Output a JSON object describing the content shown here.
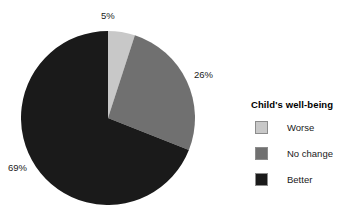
{
  "chart_data": {
    "type": "pie",
    "title": "",
    "legend_title": "Child's well-being",
    "legend_position": "right",
    "grid": false,
    "start_angle_deg": 0,
    "direction": "clockwise",
    "categories": [
      "Worse",
      "No change",
      "Better"
    ],
    "values": [
      5,
      26,
      69
    ],
    "value_labels": [
      "5%",
      "26%",
      "69%"
    ],
    "unit": "%",
    "colors": [
      "#c8c8c8",
      "#707070",
      "#1a1a1a"
    ],
    "slices": [
      {
        "label": "Worse",
        "value": 5,
        "value_label": "5%",
        "color": "#c8c8c8"
      },
      {
        "label": "No change",
        "value": 26,
        "value_label": "26%",
        "color": "#707070"
      },
      {
        "label": "Better",
        "value": 69,
        "value_label": "69%",
        "color": "#1a1a1a"
      }
    ]
  },
  "legend": {
    "title": "Child's well-being",
    "items": [
      {
        "label": "Worse",
        "color": "#c8c8c8"
      },
      {
        "label": "No change",
        "color": "#707070"
      },
      {
        "label": "Better",
        "color": "#1a1a1a"
      }
    ]
  },
  "labels": {
    "worse": "5%",
    "no_change": "26%",
    "better": "69%"
  }
}
